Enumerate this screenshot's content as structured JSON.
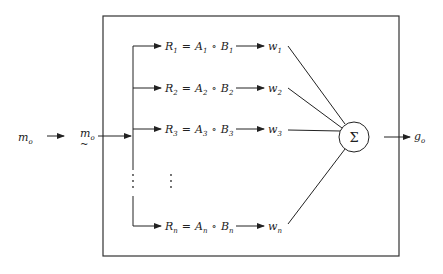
{
  "diagram": {
    "type": "block-diagram",
    "input": {
      "label": "m",
      "sub": "o"
    },
    "fuzzified_input": {
      "label": "m",
      "sub": "o",
      "tilde": "~"
    },
    "rules": [
      {
        "R": "R",
        "Rsub": "1",
        "eq": "=",
        "A": "A",
        "Asub": "1",
        "op": "∘",
        "B": "B",
        "Bsub": "1",
        "w": "w",
        "wsub": "1"
      },
      {
        "R": "R",
        "Rsub": "2",
        "eq": "=",
        "A": "A",
        "Asub": "2",
        "op": "∘",
        "B": "B",
        "Bsub": "2",
        "w": "w",
        "wsub": "2"
      },
      {
        "R": "R",
        "Rsub": "3",
        "eq": "=",
        "A": "A",
        "Asub": "3",
        "op": "∘",
        "B": "B",
        "Bsub": "3",
        "w": "w",
        "wsub": "3"
      },
      {
        "R": "R",
        "Rsub": "n",
        "eq": "=",
        "A": "A",
        "Asub": "n",
        "op": "∘",
        "B": "B",
        "Bsub": "n",
        "w": "w",
        "wsub": "n"
      }
    ],
    "ellipsis": "⋮",
    "summation": {
      "symbol": "Σ"
    },
    "output": {
      "label": "g",
      "sub": "o"
    }
  }
}
